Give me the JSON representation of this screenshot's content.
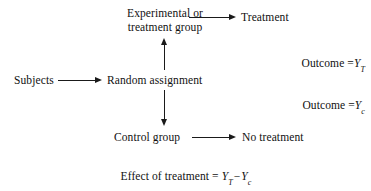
{
  "diagram": {
    "colors": {
      "background": "#ffffff",
      "text": "#111111",
      "arrow": "#1a1a1a"
    },
    "nodes": {
      "subjects": "Subjects",
      "random_assignment": "Random assignment",
      "experimental_group_line1": "Experimental or",
      "experimental_group_line2": "treatment group",
      "treatment": "Treatment",
      "control_group": "Control group",
      "no_treatment": "No treatment"
    },
    "outcomes": {
      "treatment_outcome": {
        "label": "Outcome =",
        "variable": "Y",
        "subscript": "T",
        "full_text": "Outcome = YT"
      },
      "control_outcome": {
        "label": "Outcome =",
        "variable": "Y",
        "subscript": "c",
        "full_text": "Outcome = Yc"
      }
    },
    "effect_equation": {
      "lead": "Effect of treatment =",
      "first_variable": "Y",
      "first_subscript": "T",
      "operator": "−",
      "second_variable": "Y",
      "second_subscript": "c",
      "full_text": "Effect of treatment = YT − Yc"
    },
    "arrows": [
      {
        "name": "subjects-to-random",
        "direction": "right"
      },
      {
        "name": "random-to-experimental",
        "direction": "up"
      },
      {
        "name": "random-to-control",
        "direction": "down"
      },
      {
        "name": "experimental-to-treatment",
        "direction": "right"
      },
      {
        "name": "control-to-no-treatment",
        "direction": "right"
      }
    ]
  }
}
